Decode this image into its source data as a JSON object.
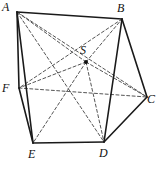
{
  "figure": {
    "width": 157,
    "height": 169,
    "background_color": "#ffffff",
    "stroke_color": "#1a1a1a",
    "dashed_color": "#555555",
    "solid_stroke_width": 1.6,
    "dashed_stroke_width": 1.0,
    "dash_pattern": "3,2.4"
  },
  "vertices": [
    {
      "id": "A",
      "label": "A",
      "x": 17,
      "y": 12,
      "label_x": 2,
      "label_y": 1,
      "apex": false
    },
    {
      "id": "B",
      "label": "B",
      "x": 122,
      "y": 19,
      "label_x": 117,
      "label_y": 2,
      "apex": false
    },
    {
      "id": "C",
      "label": "C",
      "x": 147,
      "y": 97,
      "label_x": 147,
      "label_y": 93,
      "apex": false
    },
    {
      "id": "D",
      "label": "D",
      "x": 104,
      "y": 142,
      "label_x": 99,
      "label_y": 147,
      "apex": false
    },
    {
      "id": "E",
      "label": "E",
      "x": 33,
      "y": 143,
      "label_x": 28,
      "label_y": 148,
      "apex": false
    },
    {
      "id": "F",
      "label": "F",
      "x": 19,
      "y": 88,
      "label_x": 2,
      "label_y": 82,
      "apex": false
    },
    {
      "id": "S",
      "label": "S",
      "x": 86,
      "y": 62,
      "label_x": 80,
      "label_y": 44,
      "apex": true
    }
  ],
  "edges_solid": [
    {
      "from": "A",
      "to": "B",
      "name": "edge-AB"
    },
    {
      "from": "A",
      "to": "F",
      "name": "edge-AF"
    },
    {
      "from": "A",
      "to": "E",
      "name": "edge-AE"
    },
    {
      "from": "B",
      "to": "C",
      "name": "edge-BC"
    },
    {
      "from": "B",
      "to": "D",
      "name": "edge-BD"
    },
    {
      "from": "C",
      "to": "D",
      "name": "edge-CD"
    },
    {
      "from": "D",
      "to": "E",
      "name": "edge-DE"
    },
    {
      "from": "E",
      "to": "F",
      "name": "edge-EF"
    }
  ],
  "edges_dashed": [
    {
      "from": "F",
      "to": "C",
      "name": "edge-FC-hidden"
    },
    {
      "from": "A",
      "to": "C",
      "name": "diagonal-AC"
    },
    {
      "from": "B",
      "to": "F",
      "name": "diagonal-BF"
    },
    {
      "from": "A",
      "to": "D",
      "name": "diagonal-AD"
    },
    {
      "from": "S",
      "to": "A",
      "name": "apex-edge-SA"
    },
    {
      "from": "S",
      "to": "B",
      "name": "apex-edge-SB"
    },
    {
      "from": "S",
      "to": "C",
      "name": "apex-edge-SC"
    },
    {
      "from": "S",
      "to": "D",
      "name": "apex-edge-SD"
    },
    {
      "from": "S",
      "to": "E",
      "name": "apex-edge-SE"
    },
    {
      "from": "S",
      "to": "F",
      "name": "apex-edge-SF"
    }
  ],
  "apex_marker": {
    "name": "apex-point-S",
    "radius": 2.0,
    "fill": "#111111"
  }
}
